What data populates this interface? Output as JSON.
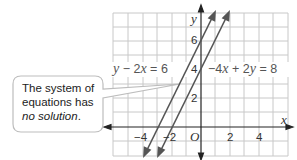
{
  "diagram": {
    "type": "coordinate-graph",
    "axes": {
      "x_label": "x",
      "y_label": "y",
      "origin_label": "O",
      "x_ticks": [
        {
          "value": -4,
          "label": "−4"
        },
        {
          "value": -2,
          "label": "−2"
        },
        {
          "value": 2,
          "label": "2"
        },
        {
          "value": 4,
          "label": "4"
        }
      ],
      "y_ticks": [
        {
          "value": 2,
          "label": "2"
        },
        {
          "value": 4,
          "label": "4"
        },
        {
          "value": 6,
          "label": "6"
        }
      ],
      "x_range": [
        -6,
        6
      ],
      "y_range": [
        -2,
        8
      ],
      "grid": true
    },
    "lines": [
      {
        "name": "line-1",
        "equation": "y − 2x = 6",
        "slope": 2,
        "intercept": 6,
        "color": "#555555"
      },
      {
        "name": "line-2",
        "equation": "−4x + 2y = 8",
        "slope": 2,
        "intercept": 4,
        "color": "#555555"
      }
    ],
    "equation_labels": {
      "left": {
        "var1": "y",
        "op1": " − 2",
        "var2": "x",
        "rest": " = 6"
      },
      "right": {
        "prefix": "−4",
        "var1": "x",
        "op": " + 2",
        "var2": "y",
        "rest": " = 8"
      }
    },
    "callout": {
      "line1": "The system of",
      "line2": "equations has",
      "emphasis": "no solution",
      "suffix": "."
    },
    "colors": {
      "grid": "#c8c8c8",
      "axis": "#222222",
      "line": "#555555",
      "callout_border": "#bdbdbd"
    }
  }
}
